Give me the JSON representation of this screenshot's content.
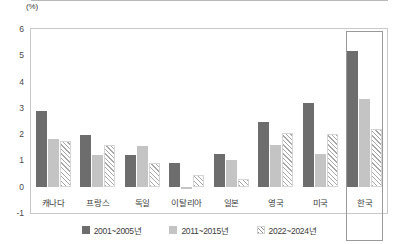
{
  "chart_data": {
    "type": "bar",
    "title": "",
    "subtitle": "",
    "xlabel": "",
    "ylabel": "",
    "unit_label": "(%)",
    "ylim": [
      -1,
      6
    ],
    "yticks": [
      6,
      5,
      4,
      3,
      2,
      1,
      0,
      -1
    ],
    "grid": false,
    "legend_position": "bottom",
    "highlight_category": "한국",
    "categories": [
      "캐나다",
      "프랑스",
      "독일",
      "이탈리아",
      "일본",
      "영국",
      "미국",
      "한국"
    ],
    "series": [
      {
        "name": "2001~2005년",
        "color": "#6d6d6d",
        "pattern": "solid",
        "values": [
          2.9,
          1.95,
          1.2,
          0.9,
          1.25,
          2.45,
          3.2,
          5.15
        ]
      },
      {
        "name": "2011~2015년",
        "color": "#c4c4c4",
        "pattern": "solid",
        "values": [
          1.8,
          1.2,
          1.55,
          -0.1,
          1.0,
          1.6,
          1.25,
          3.35
        ]
      },
      {
        "name": "2022~2024년",
        "color": "#a8a8a8",
        "pattern": "diagonal-hatch",
        "values": [
          1.75,
          1.6,
          0.9,
          0.45,
          0.3,
          2.05,
          2.0,
          2.2
        ]
      }
    ]
  }
}
